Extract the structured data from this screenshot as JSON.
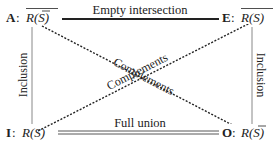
{
  "diagram": {
    "type": "square-of-opposition",
    "corners": {
      "A": {
        "letter": "A",
        "sep": ":",
        "expr": "R(S)",
        "overline_whole": true,
        "overline_S": true
      },
      "E": {
        "letter": "E",
        "sep": ":",
        "expr": "R(S)",
        "overline_whole": true,
        "overline_S": false
      },
      "I": {
        "letter": "I",
        "sep": ":",
        "expr": "R(S)",
        "overline_whole": false,
        "overline_S": false
      },
      "O": {
        "letter": "O",
        "sep": ":",
        "expr": "R(S)",
        "overline_whole": false,
        "overline_S": true
      }
    },
    "edges": {
      "top": {
        "label": "Empty intersection",
        "style": "thick-solid"
      },
      "bottom": {
        "label": "Full union",
        "style": "double"
      },
      "left": {
        "label": "Inclusion",
        "style": "thin-gray"
      },
      "right": {
        "label": "Inclusion",
        "style": "thin-gray"
      },
      "diagonal_AO": {
        "label": "Complements",
        "style": "dotted"
      },
      "diagonal_IE": {
        "label": "Complements",
        "style": "dotted"
      }
    },
    "colors": {
      "ink": "#222222",
      "gray_line": "#888888",
      "background": "#ffffff"
    }
  }
}
